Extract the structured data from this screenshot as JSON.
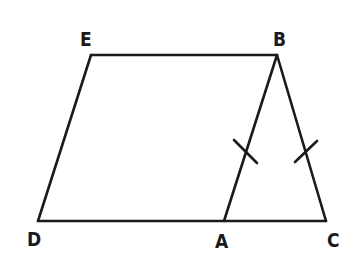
{
  "diagram": {
    "points": {
      "E": {
        "label": "E",
        "x": 91,
        "y": 55
      },
      "B": {
        "label": "B",
        "x": 277,
        "y": 55
      },
      "D": {
        "label": "D",
        "x": 38,
        "y": 221
      },
      "A": {
        "label": "A",
        "x": 224,
        "y": 221
      },
      "C": {
        "label": "C",
        "x": 326,
        "y": 221
      }
    },
    "segments": [
      "EB",
      "ED",
      "DC",
      "BA",
      "BC"
    ],
    "tick_marks": [
      {
        "segment": "AB",
        "count": 1
      },
      {
        "segment": "BC",
        "count": 1
      }
    ],
    "line_color": "#1a1a1a",
    "background": "#ffffff"
  }
}
